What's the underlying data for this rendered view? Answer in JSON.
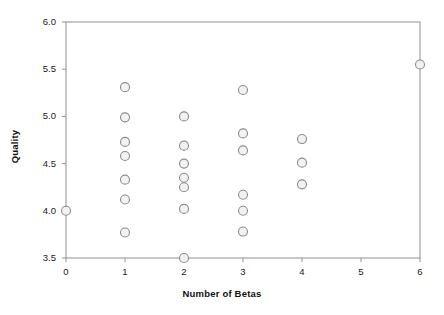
{
  "chart_data": {
    "type": "scatter",
    "title": "",
    "xlabel": "Number of Betas",
    "ylabel": "Quality",
    "xlim": [
      0,
      6
    ],
    "ylim": [
      3.5,
      6.0
    ],
    "grid": false,
    "legend": false,
    "xticks": [
      "0",
      "1",
      "2",
      "3",
      "4",
      "5",
      "6"
    ],
    "yticks": [
      "3.5",
      "4.0",
      "4.5",
      "5.0",
      "5.5",
      "6.0"
    ],
    "marker": {
      "shape": "circle",
      "fill_color": "#f2f2f2",
      "edge_color": "#8c8c8c",
      "size": 9
    },
    "series": [
      {
        "name": "Quality vs Number of Betas",
        "points": [
          {
            "x": 0,
            "y": 4.0
          },
          {
            "x": 1,
            "y": 5.31
          },
          {
            "x": 1,
            "y": 4.99
          },
          {
            "x": 1,
            "y": 4.73
          },
          {
            "x": 1,
            "y": 4.58
          },
          {
            "x": 1,
            "y": 4.33
          },
          {
            "x": 1,
            "y": 4.12
          },
          {
            "x": 1,
            "y": 3.77
          },
          {
            "x": 2,
            "y": 5.0
          },
          {
            "x": 2,
            "y": 4.69
          },
          {
            "x": 2,
            "y": 4.5
          },
          {
            "x": 2,
            "y": 4.35
          },
          {
            "x": 2,
            "y": 4.25
          },
          {
            "x": 2,
            "y": 4.02
          },
          {
            "x": 2,
            "y": 3.5
          },
          {
            "x": 3,
            "y": 5.28
          },
          {
            "x": 3,
            "y": 4.82
          },
          {
            "x": 3,
            "y": 4.64
          },
          {
            "x": 3,
            "y": 4.17
          },
          {
            "x": 3,
            "y": 4.0
          },
          {
            "x": 3,
            "y": 3.78
          },
          {
            "x": 4,
            "y": 4.76
          },
          {
            "x": 4,
            "y": 4.51
          },
          {
            "x": 4,
            "y": 4.28
          },
          {
            "x": 6,
            "y": 5.55
          }
        ]
      }
    ]
  },
  "axes": {
    "x_title": "Number of Betas",
    "y_title": "Quality"
  }
}
